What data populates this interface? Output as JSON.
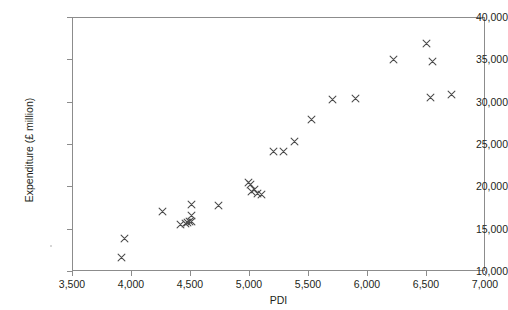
{
  "chart_data": {
    "type": "scatter",
    "title": "",
    "xlabel": "PDI",
    "ylabel": "Expenditure (£ million)",
    "xlim": [
      3500,
      7000
    ],
    "ylim": [
      10000,
      40000
    ],
    "xticks": [
      3500,
      4000,
      4500,
      5000,
      5500,
      6000,
      6500,
      7000
    ],
    "yticks": [
      10000,
      15000,
      20000,
      25000,
      30000,
      35000,
      40000
    ],
    "xtick_labels": [
      "3,500",
      "4,000",
      "4,500",
      "5,000",
      "5,500",
      "6,000",
      "6,500",
      "7,000"
    ],
    "ytick_labels": [
      "10,000",
      "15,000",
      "20,000",
      "25,000",
      "30,000",
      "35,000",
      "40,000"
    ],
    "grid": false,
    "legend": null,
    "marker": "x",
    "marker_color": "#4c4c4c",
    "x": [
      3910,
      3935,
      4255,
      4410,
      4450,
      4470,
      4490,
      4500,
      4500,
      4505,
      4730,
      4990,
      5000,
      5010,
      5040,
      5060,
      5100,
      5195,
      5285,
      5375,
      5525,
      5700,
      5890,
      6220,
      6495,
      6530,
      6550,
      6710
    ],
    "y": [
      11700,
      14000,
      17100,
      15600,
      15700,
      15900,
      16000,
      16700,
      18000,
      15950,
      17900,
      20600,
      20300,
      19500,
      19700,
      19300,
      19200,
      24200,
      24200,
      25400,
      28050,
      30400,
      30450,
      35100,
      37000,
      30600,
      34900,
      31000
    ],
    "points": [
      {
        "x": 3910,
        "y": 11700
      },
      {
        "x": 3935,
        "y": 14000
      },
      {
        "x": 4255,
        "y": 17100
      },
      {
        "x": 4410,
        "y": 15600
      },
      {
        "x": 4450,
        "y": 15700
      },
      {
        "x": 4470,
        "y": 15900
      },
      {
        "x": 4490,
        "y": 16000
      },
      {
        "x": 4500,
        "y": 16700
      },
      {
        "x": 4500,
        "y": 18000
      },
      {
        "x": 4505,
        "y": 15950
      },
      {
        "x": 4730,
        "y": 17900
      },
      {
        "x": 4990,
        "y": 20600
      },
      {
        "x": 5000,
        "y": 20300
      },
      {
        "x": 5010,
        "y": 19500
      },
      {
        "x": 5040,
        "y": 19700
      },
      {
        "x": 5060,
        "y": 19300
      },
      {
        "x": 5100,
        "y": 19200
      },
      {
        "x": 5195,
        "y": 24200
      },
      {
        "x": 5285,
        "y": 24200
      },
      {
        "x": 5375,
        "y": 25400
      },
      {
        "x": 5525,
        "y": 28050
      },
      {
        "x": 5700,
        "y": 30400
      },
      {
        "x": 5890,
        "y": 30450
      },
      {
        "x": 6220,
        "y": 35100
      },
      {
        "x": 6495,
        "y": 37000
      },
      {
        "x": 6530,
        "y": 30600
      },
      {
        "x": 6550,
        "y": 34900
      },
      {
        "x": 6710,
        "y": 31000
      }
    ]
  }
}
